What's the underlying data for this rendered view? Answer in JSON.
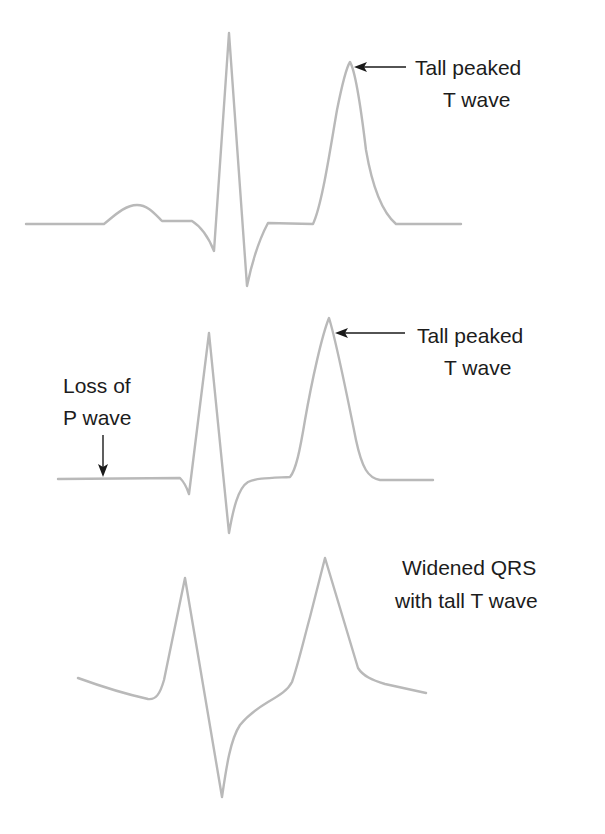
{
  "colors": {
    "trace": "#b9b9b9",
    "text": "#1c1c1c",
    "background": "#ffffff"
  },
  "panels": [
    {
      "id": "early-hyperkalemia",
      "annotation": {
        "line1": "Tall peaked",
        "line2": "T wave"
      },
      "features": [
        "P wave present",
        "narrow QRS",
        "tall peaked T wave"
      ]
    },
    {
      "id": "moderate-hyperkalemia",
      "annotation": {
        "line1": "Tall peaked",
        "line2": "T wave"
      },
      "left_annotation": {
        "line1": "Loss of",
        "line2": "P wave"
      },
      "features": [
        "absent P wave",
        "narrow QRS",
        "tall peaked T wave"
      ]
    },
    {
      "id": "severe-hyperkalemia",
      "annotation": {
        "line1": "Widened QRS",
        "line2": "with tall T wave"
      },
      "features": [
        "absent P wave",
        "widened QRS",
        "tall T wave"
      ]
    }
  ]
}
